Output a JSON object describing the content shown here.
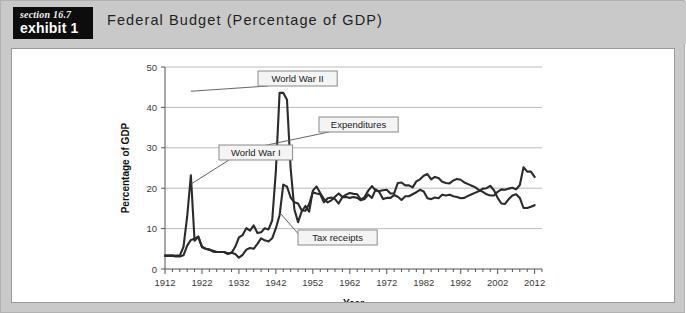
{
  "header": {
    "section_label": "section 16.7",
    "exhibit_label": "exhibit 1",
    "title": "Federal Budget (Percentage of GDP)"
  },
  "colors": {
    "frame_background": "#c9c9c9",
    "panel_background": "#ffffff",
    "tag_background": "#0d0d0d",
    "series_line": "#2b2b2b",
    "gridline": "#a8a8a8",
    "callout_fill": "#f4f4f4",
    "callout_border": "#8a8a8a"
  },
  "chart_data": {
    "type": "line",
    "title": "Federal Budget (Percentage of GDP)",
    "xlabel": "Year",
    "ylabel": "Percentage of GDP",
    "xlim": [
      1912,
      2014
    ],
    "ylim": [
      0,
      50
    ],
    "xticks": [
      1912,
      1922,
      1932,
      1942,
      1952,
      1962,
      1972,
      1982,
      1992,
      2002,
      2012
    ],
    "yticks": [
      0,
      10,
      20,
      30,
      40,
      50
    ],
    "grid": "horizontal",
    "legend_position": "none",
    "annotations": [
      {
        "label": "World War II",
        "x": 1943,
        "y": 44
      },
      {
        "label": "Expenditures",
        "x": 1945,
        "y": 30
      },
      {
        "label": "World War I",
        "x": 1919,
        "y": 23
      },
      {
        "label": "Tax receipts",
        "x": 1944,
        "y": 21
      }
    ],
    "x": [
      1912,
      1913,
      1914,
      1915,
      1916,
      1917,
      1918,
      1919,
      1920,
      1921,
      1922,
      1923,
      1924,
      1925,
      1926,
      1927,
      1928,
      1929,
      1930,
      1931,
      1932,
      1933,
      1934,
      1935,
      1936,
      1937,
      1938,
      1939,
      1940,
      1941,
      1942,
      1943,
      1944,
      1945,
      1946,
      1947,
      1948,
      1949,
      1950,
      1951,
      1952,
      1953,
      1954,
      1955,
      1956,
      1957,
      1958,
      1959,
      1960,
      1961,
      1962,
      1963,
      1964,
      1965,
      1966,
      1967,
      1968,
      1969,
      1970,
      1971,
      1972,
      1973,
      1974,
      1975,
      1976,
      1977,
      1978,
      1979,
      1980,
      1981,
      1982,
      1983,
      1984,
      1985,
      1986,
      1987,
      1988,
      1989,
      1990,
      1991,
      1992,
      1993,
      1994,
      1995,
      1996,
      1997,
      1998,
      1999,
      2000,
      2001,
      2002,
      2003,
      2004,
      2005,
      2006,
      2007,
      2008,
      2009,
      2010,
      2011,
      2012
    ],
    "series": [
      {
        "name": "Expenditures",
        "values": [
          3.4,
          3.4,
          3.4,
          3.3,
          3.3,
          5.5,
          13.0,
          23.2,
          7.0,
          8.0,
          5.4,
          5.0,
          4.8,
          4.5,
          4.2,
          4.2,
          4.2,
          3.7,
          4.0,
          5.5,
          7.8,
          8.4,
          10.1,
          9.5,
          10.8,
          8.9,
          9.1,
          10.1,
          9.8,
          12.0,
          24.3,
          43.6,
          43.6,
          41.9,
          24.8,
          14.8,
          11.6,
          14.3,
          15.6,
          14.2,
          19.4,
          20.4,
          18.8,
          17.3,
          16.5,
          17.0,
          17.9,
          18.7,
          17.8,
          18.4,
          18.8,
          18.6,
          18.5,
          17.2,
          17.8,
          19.4,
          20.5,
          19.4,
          19.3,
          19.5,
          19.6,
          18.7,
          18.7,
          21.3,
          21.4,
          20.7,
          20.7,
          20.2,
          21.7,
          22.2,
          23.1,
          23.5,
          22.2,
          22.8,
          22.5,
          21.6,
          21.3,
          21.2,
          21.9,
          22.3,
          22.1,
          21.4,
          21.0,
          20.6,
          20.2,
          19.5,
          19.1,
          18.5,
          18.2,
          18.2,
          19.1,
          19.7,
          19.6,
          19.9,
          20.1,
          19.7,
          20.8,
          25.2,
          24.1,
          24.1,
          22.8
        ]
      },
      {
        "name": "Tax receipts",
        "values": [
          3.2,
          3.2,
          3.2,
          3.1,
          3.1,
          3.4,
          5.8,
          7.2,
          7.5,
          8.0,
          5.6,
          5.0,
          4.8,
          4.3,
          4.2,
          4.2,
          4.2,
          3.9,
          4.0,
          3.7,
          2.8,
          3.5,
          4.8,
          5.2,
          5.0,
          6.2,
          7.6,
          7.1,
          6.8,
          7.6,
          10.1,
          13.3,
          20.9,
          20.4,
          17.7,
          16.5,
          16.2,
          14.5,
          14.4,
          16.1,
          19.0,
          18.7,
          18.5,
          16.5,
          17.5,
          17.7,
          17.3,
          16.2,
          17.8,
          17.8,
          17.6,
          17.8,
          17.6,
          17.0,
          17.3,
          18.4,
          17.6,
          19.7,
          19.0,
          17.3,
          17.6,
          17.6,
          18.3,
          17.9,
          17.1,
          18.0,
          18.0,
          18.5,
          19.0,
          19.6,
          19.2,
          17.5,
          17.3,
          17.7,
          17.5,
          18.4,
          18.2,
          18.4,
          18.0,
          17.8,
          17.5,
          17.6,
          18.1,
          18.5,
          18.9,
          19.3,
          19.9,
          20.0,
          20.6,
          19.5,
          17.6,
          16.2,
          16.1,
          17.3,
          18.2,
          18.5,
          17.6,
          15.1,
          15.1,
          15.4,
          15.8
        ]
      }
    ]
  }
}
